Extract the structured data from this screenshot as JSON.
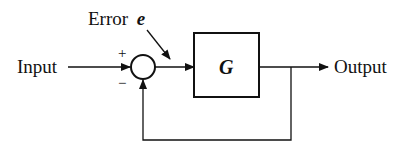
{
  "diagram": {
    "type": "feedback-control-loop",
    "labels": {
      "input": "Input",
      "output": "Output",
      "error_prefix": "Error",
      "error_symbol": "e",
      "block": "G",
      "plus": "+",
      "minus": "−"
    },
    "colors": {
      "stroke": "#111111",
      "background": "#ffffff"
    },
    "nodes": [
      {
        "id": "input",
        "kind": "signal",
        "label": "Input"
      },
      {
        "id": "sum",
        "kind": "summing-junction",
        "signs": [
          "+",
          "−"
        ]
      },
      {
        "id": "G",
        "kind": "block",
        "label": "G"
      },
      {
        "id": "output",
        "kind": "signal",
        "label": "Output"
      }
    ],
    "edges": [
      {
        "from": "input",
        "to": "sum",
        "sign": "+"
      },
      {
        "from": "sum",
        "to": "G",
        "label": "Error e"
      },
      {
        "from": "G",
        "to": "output"
      },
      {
        "from": "output",
        "to": "sum",
        "sign": "−",
        "kind": "feedback"
      }
    ]
  }
}
